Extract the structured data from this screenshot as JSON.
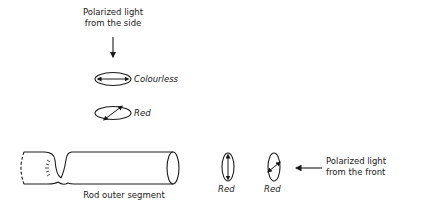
{
  "top_label": {
    "line1": "Polarized light",
    "line2": "from the side"
  },
  "side_states": [
    {
      "orientation": "horizontal",
      "label": "Colourless"
    },
    {
      "orientation": "diagonal",
      "label": "Red"
    }
  ],
  "rod_label": "Rod outer segment",
  "front_states": [
    {
      "orientation": "vertical",
      "label": "Red"
    },
    {
      "orientation": "diagonal",
      "label": "Red"
    }
  ],
  "right_label": {
    "line1": "Polarized light",
    "line2": "from the front"
  }
}
